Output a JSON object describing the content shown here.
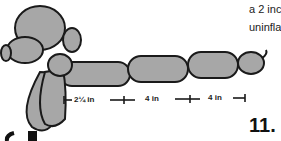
{
  "text_lines": [
    "a 2 inc",
    "uninfla"
  ],
  "step_number": "11.",
  "dimensions": [
    "2¼ in",
    "4 in",
    "4 in"
  ],
  "colors": {
    "balloon": "#a7a7a7",
    "outline": "#1a1a1a",
    "shade": "#7d7d7d"
  }
}
